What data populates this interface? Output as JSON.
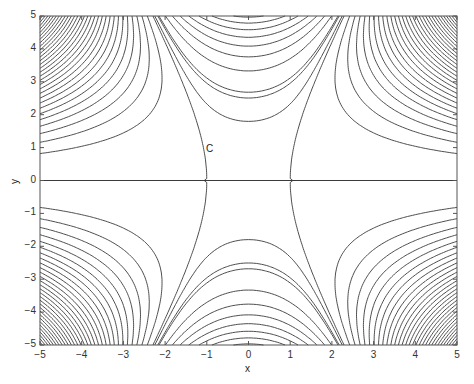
{
  "chart_data": {
    "type": "contour",
    "title": "",
    "xlabel": "x",
    "ylabel": "y",
    "xlim": [
      -5,
      5
    ],
    "ylim": [
      -5,
      5
    ],
    "xticks": [
      -5,
      -4,
      -3,
      -2,
      -1,
      0,
      1,
      2,
      3,
      4,
      5
    ],
    "yticks": [
      -5,
      -4,
      -3,
      -2,
      -1,
      0,
      1,
      2,
      3,
      4,
      5
    ],
    "grid": false,
    "annotations": [
      {
        "text": "C",
        "x": -1.1,
        "y": 1.0
      }
    ],
    "approx_function": "f(x,y) = y^2 * (x^2 - 1 - 0.17*y^2)",
    "level_step": 16,
    "line_color": "#3a3a3a"
  },
  "labels": {
    "xlabel": "x",
    "ylabel": "y",
    "annotation": "C"
  }
}
